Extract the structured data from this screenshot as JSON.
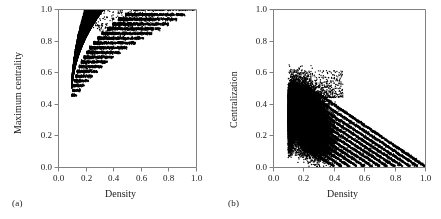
{
  "figure": {
    "background": "#ffffff",
    "point_color": "#000000",
    "axis_color": "#808080",
    "text_color": "#1a1a1a",
    "width": 441,
    "height": 219
  },
  "panels": [
    {
      "key": "a",
      "sublabel": "(a)",
      "xlabel": "Density",
      "ylabel": "Maximum centrality"
    },
    {
      "key": "b",
      "sublabel": "(b)",
      "xlabel": "Density",
      "ylabel": "Centralization"
    }
  ],
  "chart_data": [
    {
      "type": "scatter",
      "panel": "(a)",
      "title": "",
      "xlabel": "Density",
      "ylabel": "Maximum centrality",
      "xlim": [
        0.0,
        1.0
      ],
      "ylim": [
        0.0,
        1.0
      ],
      "xticks": [
        0.0,
        0.2,
        0.4,
        0.6,
        0.8,
        1.0
      ],
      "yticks": [
        0.0,
        0.2,
        0.4,
        0.6,
        0.8,
        1.0
      ],
      "xticklabels": [
        "0.0",
        "0.2",
        "0.4",
        "0.6",
        "0.8",
        "1.0"
      ],
      "yticklabels": [
        "0.0",
        "0.2",
        "0.4",
        "0.6",
        "0.8",
        "1.0"
      ],
      "grid": false,
      "legend": null,
      "marker": "filled-circle",
      "marker_size_px": 1.4,
      "description": "Dense monotone-increasing wedge of points. Lower boundary rises from about (0.10, 0.45) steeply to (0.20, 0.62) then flattens toward (1.0, 1.0). Points are organized into discrete horizontal bands (quantised maximum-centrality levels) that fan out to the right; the highest band sits at y = 1.0 and spans x from about 0.55 to 1.0.",
      "x_range_observed": [
        0.1,
        1.0
      ],
      "y_range_observed": [
        0.44,
        1.01
      ],
      "cluster_core": {
        "x": [
          0.11,
          0.25
        ],
        "y": [
          0.5,
          0.82
        ]
      },
      "bands": [
        {
          "y": 1.0,
          "x_start": 0.55,
          "x_end": 1.0
        },
        {
          "y": 0.965,
          "x_start": 0.49,
          "x_end": 0.92
        },
        {
          "y": 0.935,
          "x_start": 0.44,
          "x_end": 0.86
        },
        {
          "y": 0.905,
          "x_start": 0.4,
          "x_end": 0.8
        },
        {
          "y": 0.875,
          "x_start": 0.36,
          "x_end": 0.74
        },
        {
          "y": 0.845,
          "x_start": 0.32,
          "x_end": 0.68
        },
        {
          "y": 0.815,
          "x_start": 0.29,
          "x_end": 0.62
        },
        {
          "y": 0.785,
          "x_start": 0.26,
          "x_end": 0.56
        },
        {
          "y": 0.755,
          "x_start": 0.23,
          "x_end": 0.5
        },
        {
          "y": 0.725,
          "x_start": 0.21,
          "x_end": 0.45
        },
        {
          "y": 0.695,
          "x_start": 0.19,
          "x_end": 0.4
        },
        {
          "y": 0.665,
          "x_start": 0.17,
          "x_end": 0.36
        },
        {
          "y": 0.635,
          "x_start": 0.155,
          "x_end": 0.32
        },
        {
          "y": 0.605,
          "x_start": 0.14,
          "x_end": 0.285
        },
        {
          "y": 0.575,
          "x_start": 0.13,
          "x_end": 0.25
        },
        {
          "y": 0.545,
          "x_start": 0.12,
          "x_end": 0.22
        },
        {
          "y": 0.515,
          "x_start": 0.112,
          "x_end": 0.19
        },
        {
          "y": 0.485,
          "x_start": 0.106,
          "x_end": 0.162
        },
        {
          "y": 0.455,
          "x_start": 0.1,
          "x_end": 0.135
        }
      ]
    },
    {
      "type": "scatter",
      "panel": "(b)",
      "title": "",
      "xlabel": "Density",
      "ylabel": "Centralization",
      "xlim": [
        0.0,
        1.0
      ],
      "ylim": [
        0.0,
        1.0
      ],
      "xticks": [
        0.0,
        0.2,
        0.4,
        0.6,
        0.8,
        1.0
      ],
      "yticks": [
        0.0,
        0.2,
        0.4,
        0.6,
        0.8,
        1.0
      ],
      "xticklabels": [
        "0.0",
        "0.2",
        "0.4",
        "0.6",
        "0.8",
        "1.0"
      ],
      "yticklabels": [
        "0.0",
        "0.2",
        "0.4",
        "0.6",
        "0.8",
        "1.0"
      ],
      "grid": false,
      "legend": null,
      "marker": "filled-circle",
      "marker_size_px": 1.4,
      "description": "Dense elliptical blob centred near (0.22, 0.30) spanning x 0.10-0.42 and y 0.08-0.55, from which a family of parallel negatively-sloped straight streaks emerges and converges toward (1.0, 0.0). Each streak has slope about -0.55 and the streaks are evenly offset.",
      "x_range_observed": [
        0.1,
        1.0
      ],
      "y_range_observed": [
        0.0,
        0.6
      ],
      "cluster_core": {
        "x": [
          0.13,
          0.36
        ],
        "y": [
          0.16,
          0.46
        ]
      },
      "streaks": [
        {
          "x_start": 0.3,
          "y_start": 0.46,
          "x_end": 1.0,
          "y_end": 0.005
        },
        {
          "x_start": 0.3,
          "y_start": 0.42,
          "x_end": 0.95,
          "y_end": 0.005
        },
        {
          "x_start": 0.29,
          "y_start": 0.39,
          "x_end": 0.9,
          "y_end": 0.005
        },
        {
          "x_start": 0.28,
          "y_start": 0.365,
          "x_end": 0.85,
          "y_end": 0.005
        },
        {
          "x_start": 0.27,
          "y_start": 0.34,
          "x_end": 0.8,
          "y_end": 0.005
        },
        {
          "x_start": 0.26,
          "y_start": 0.315,
          "x_end": 0.75,
          "y_end": 0.005
        },
        {
          "x_start": 0.25,
          "y_start": 0.29,
          "x_end": 0.7,
          "y_end": 0.005
        },
        {
          "x_start": 0.24,
          "y_start": 0.265,
          "x_end": 0.65,
          "y_end": 0.005
        },
        {
          "x_start": 0.23,
          "y_start": 0.24,
          "x_end": 0.6,
          "y_end": 0.005
        },
        {
          "x_start": 0.22,
          "y_start": 0.215,
          "x_end": 0.55,
          "y_end": 0.005
        },
        {
          "x_start": 0.21,
          "y_start": 0.19,
          "x_end": 0.5,
          "y_end": 0.005
        },
        {
          "x_start": 0.2,
          "y_start": 0.165,
          "x_end": 0.45,
          "y_end": 0.005
        },
        {
          "x_start": 0.185,
          "y_start": 0.14,
          "x_end": 0.4,
          "y_end": 0.005
        }
      ]
    }
  ]
}
